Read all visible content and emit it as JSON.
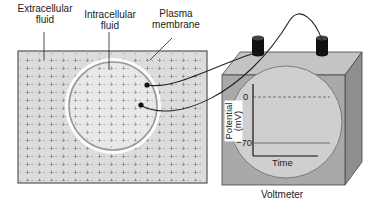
{
  "labels": {
    "extracellular": [
      "Extracellular",
      "fluid"
    ],
    "intracellular": [
      "Intracellular",
      "fluid"
    ],
    "membrane": [
      "Plasma",
      "membrane"
    ],
    "voltmeter": "Voltmeter"
  },
  "display": {
    "y_axis_label": [
      "Potential",
      "(mV)"
    ],
    "x_axis_label": "Time",
    "ticks": [
      "0",
      "−70"
    ],
    "zero_line_style": "dashed",
    "resting_line_value_mV": -70
  },
  "charges": {
    "outside_pattern": "+ − + −",
    "membrane_outer": "+",
    "membrane_inner": "−"
  },
  "colors": {
    "fluid_fill": "#dcdcdc",
    "box_front": "#a9a9a9",
    "box_top": "#c4c4c4",
    "box_side": "#8e8e8e",
    "screen": "#cfcfcf",
    "line": "#222222"
  }
}
